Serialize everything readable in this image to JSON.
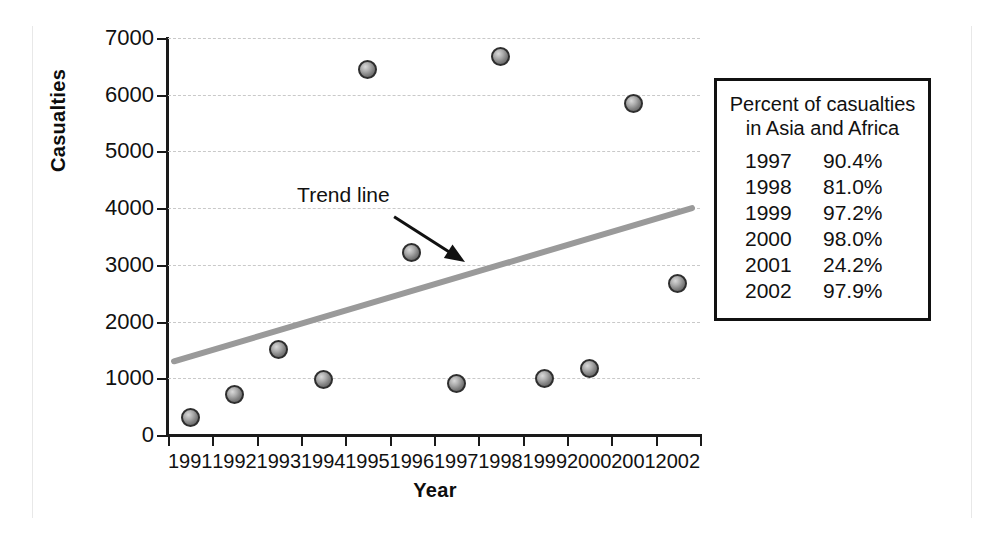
{
  "chart_data": {
    "type": "scatter",
    "title": "",
    "xlabel": "Year",
    "ylabel": "Casualties",
    "x": [
      1991,
      1992,
      1993,
      1994,
      1995,
      1996,
      1997,
      1998,
      1999,
      2000,
      2001,
      2002
    ],
    "categories": [
      "1991",
      "1992",
      "1993",
      "1994",
      "1995",
      "1996",
      "1997",
      "1998",
      "1999",
      "2000",
      "2001",
      "2002"
    ],
    "values": [
      300,
      710,
      1500,
      980,
      6440,
      3220,
      900,
      6680,
      990,
      1170,
      5850,
      2670
    ],
    "series": [
      {
        "name": "Casualties",
        "values": [
          300,
          710,
          1500,
          980,
          6440,
          3220,
          900,
          6680,
          990,
          1170,
          5850,
          2670
        ]
      }
    ],
    "ylim": [
      0,
      7000
    ],
    "ytick_labels": [
      "0",
      "1000",
      "2000",
      "3000",
      "4000",
      "5000",
      "6000",
      "7000"
    ],
    "ytick_values": [
      0,
      1000,
      2000,
      3000,
      4000,
      5000,
      6000,
      7000
    ],
    "xtick_labels": [
      "1991",
      "1992",
      "1993",
      "1994",
      "1995",
      "1996",
      "1997",
      "1998",
      "1999",
      "2000",
      "2001",
      "2002"
    ],
    "grid": "horizontal-dashed",
    "legend": "none",
    "trend_line": {
      "label": "Trend line",
      "start": {
        "x": 1991.0,
        "y": 1300
      },
      "end": {
        "x": 2002.0,
        "y": 4000
      },
      "color": "#9a9a9a"
    },
    "annotations": [
      {
        "text": "Trend line",
        "arrow_from": {
          "x": 1995.6,
          "y": 3850
        },
        "arrow_to": {
          "x": 1997.2,
          "y": 3050
        }
      }
    ],
    "colors": {
      "marker_fill": "#9e9e9e",
      "marker_edge": "#2e2e2e",
      "axis": "#1a1a1a",
      "grid": "#c9c9c9",
      "trend": "#9a9a9a",
      "text": "#111111"
    }
  },
  "side_table": {
    "title_line1": "Percent of casualties",
    "title_line2": "in Asia and Africa",
    "rows": [
      {
        "year": "1997",
        "percent": "90.4%"
      },
      {
        "year": "1998",
        "percent": "81.0%"
      },
      {
        "year": "1999",
        "percent": "97.2%"
      },
      {
        "year": "2000",
        "percent": "98.0%"
      },
      {
        "year": "2001",
        "percent": "24.2%"
      },
      {
        "year": "2002",
        "percent": "97.9%"
      }
    ]
  }
}
